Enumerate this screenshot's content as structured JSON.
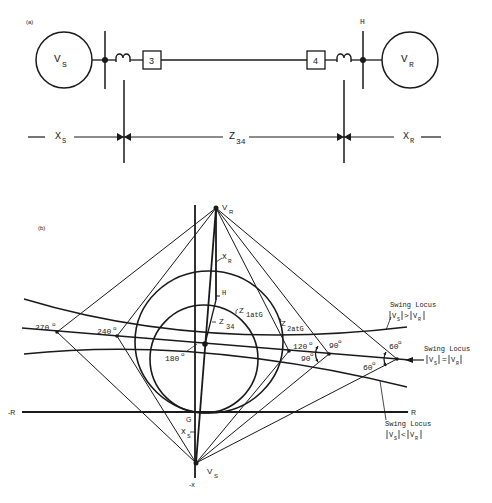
{
  "part_a": {
    "panel_label": "(a)",
    "source": {
      "label": "V",
      "sub": "S"
    },
    "receiver": {
      "label": "V",
      "sub": "R"
    },
    "breaker_left": "3",
    "breaker_right": "4",
    "bus_label": "H",
    "dim_left": {
      "label": "X",
      "sub": "S"
    },
    "dim_mid": {
      "label": "Z",
      "sub": "34"
    },
    "dim_right": {
      "label": "X",
      "sub": "R"
    }
  },
  "part_b": {
    "panel_label": "(b)",
    "vr": {
      "label": "V",
      "sub": "R"
    },
    "vs": {
      "label": "V",
      "sub": "S"
    },
    "xr": {
      "label": "X",
      "sub": "R"
    },
    "xs": {
      "label": "X",
      "sub": "S"
    },
    "h_label": "H",
    "g_label": "G",
    "z34": {
      "label": "Z",
      "sub": "34"
    },
    "z1": {
      "label": "Z",
      "sub": "1atG"
    },
    "z2": {
      "label": "Z",
      "sub": "2atG"
    },
    "axis_neg_r": "-R",
    "axis_pos_r": "R",
    "axis_neg_x": "-x",
    "angles": {
      "a270": "270",
      "a240": "240",
      "a180": "180",
      "a120": "120",
      "a90_upper": "90",
      "a90_lower": "90",
      "a60_upper": "60",
      "a60_lower": "60",
      "degree": "o"
    },
    "swing_greater": {
      "title": "Swing Locus",
      "expr_left": "V",
      "sub_left": "S",
      "op": ">",
      "expr_right": "V",
      "sub_right": "R"
    },
    "swing_equal": {
      "title": "Swing Locus",
      "expr_left": "V",
      "sub_left": "S",
      "op": "=",
      "expr_right": "V",
      "sub_right": "R"
    },
    "swing_less": {
      "title": "Swing Locus",
      "expr_left": "V",
      "sub_left": "S",
      "op": "<",
      "expr_right": "V",
      "sub_right": "R"
    }
  }
}
